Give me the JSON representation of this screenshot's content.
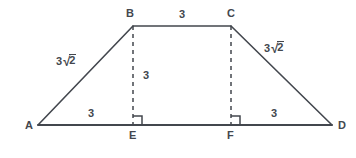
{
  "figure": {
    "kind": "isosceles-trapezoid-with-altitudes",
    "stroke_color": "#43474e",
    "background_color": "#ffffff",
    "vertices": [
      {
        "name": "A",
        "label": "A",
        "x": 38,
        "y": 125,
        "label_x": 25,
        "label_y": 121
      },
      {
        "name": "B",
        "label": "B",
        "x": 133,
        "y": 26,
        "label_x": 126,
        "label_y": 9
      },
      {
        "name": "C",
        "label": "C",
        "x": 231,
        "y": 26,
        "label_x": 227,
        "label_y": 9
      },
      {
        "name": "D",
        "label": "D",
        "x": 332,
        "y": 125,
        "label_x": 338,
        "label_y": 121
      },
      {
        "name": "E",
        "label": "E",
        "x": 133,
        "y": 125,
        "label_x": 129,
        "label_y": 131
      },
      {
        "name": "F",
        "label": "F",
        "x": 231,
        "y": 125,
        "label_x": 227,
        "label_y": 131
      }
    ],
    "solid_segments": [
      {
        "name": "side-AB",
        "from": "A",
        "to": "B"
      },
      {
        "name": "side-BC",
        "from": "B",
        "to": "C"
      },
      {
        "name": "side-CD",
        "from": "C",
        "to": "D"
      },
      {
        "name": "base-AD",
        "from": "A",
        "to": "D"
      }
    ],
    "dashed_segments": [
      {
        "name": "altitude-BE",
        "from": "B",
        "to": "E"
      },
      {
        "name": "altitude-CF",
        "from": "C",
        "to": "F"
      }
    ],
    "right_angle_marks": [
      {
        "name": "right-angle-at-E",
        "x": 133,
        "y": 125,
        "size": 9,
        "opens": "right-up"
      },
      {
        "name": "right-angle-at-F",
        "x": 231,
        "y": 125,
        "size": 9,
        "opens": "right-up"
      }
    ],
    "measure_labels": [
      {
        "name": "length-AB",
        "segment": "AB",
        "text": "3√2",
        "coefficient": "3",
        "radicand": "2",
        "is_radical": true,
        "x": 56,
        "y": 55
      },
      {
        "name": "length-BC",
        "segment": "BC",
        "text": "3",
        "is_radical": false,
        "x": 179,
        "y": 10
      },
      {
        "name": "length-CD",
        "segment": "CD",
        "text": "3√2",
        "coefficient": "3",
        "radicand": "2",
        "is_radical": true,
        "x": 264,
        "y": 42
      },
      {
        "name": "length-BE",
        "segment": "BE",
        "text": "3",
        "is_radical": false,
        "x": 143,
        "y": 70
      },
      {
        "name": "length-AE",
        "segment": "AE",
        "text": "3",
        "is_radical": false,
        "x": 88,
        "y": 108
      },
      {
        "name": "length-FD",
        "segment": "FD",
        "text": "3",
        "is_radical": false,
        "x": 271,
        "y": 108
      }
    ]
  }
}
